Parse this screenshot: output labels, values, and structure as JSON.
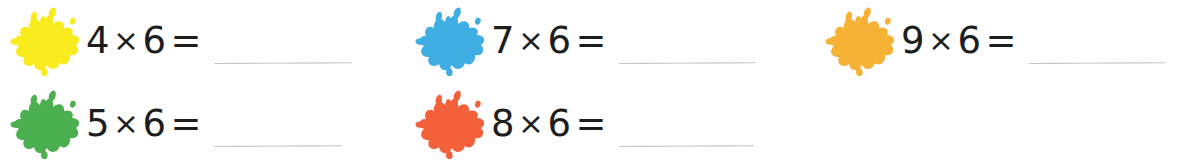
{
  "worksheet": {
    "background_color": "#fefefe",
    "text_color": "#1d1d1d",
    "line_color": "#c0c0c0",
    "columns": 3,
    "rows": 2,
    "operator_symbol": "×",
    "equals_symbol": "=",
    "answer_blank": ""
  },
  "problems": [
    {
      "id": "problem-4x6",
      "position": "row1-col1",
      "splat_name": "paint-splat-yellow",
      "splat_color": "#F9EC1E",
      "multiplicand": "4",
      "operator": "×",
      "multiplier": "6",
      "equals": "=",
      "answer": "",
      "line_width": 138
    },
    {
      "id": "problem-7x6",
      "position": "row1-col2",
      "splat_name": "paint-splat-blue",
      "splat_color": "#3FAEE3",
      "multiplicand": "7",
      "operator": "×",
      "multiplier": "6",
      "equals": "=",
      "answer": "",
      "line_width": 137
    },
    {
      "id": "problem-9x6",
      "position": "row1-col3",
      "splat_name": "paint-splat-amber",
      "splat_color": "#F5B235",
      "multiplicand": "9",
      "operator": "×",
      "multiplier": "6",
      "equals": "=",
      "answer": "",
      "line_width": 136
    },
    {
      "id": "problem-5x6",
      "position": "row2-col1",
      "splat_name": "paint-splat-green",
      "splat_color": "#4CAF4F",
      "multiplicand": "5",
      "operator": "×",
      "multiplier": "6",
      "equals": "=",
      "answer": "",
      "line_width": 128
    },
    {
      "id": "problem-8x6",
      "position": "row2-col2",
      "splat_name": "paint-splat-orange",
      "splat_color": "#F4603A",
      "multiplicand": "8",
      "operator": "×",
      "multiplier": "6",
      "equals": "=",
      "answer": "",
      "line_width": 135
    },
    {
      "id": "problem-empty",
      "position": "row2-col3",
      "splat_name": "",
      "splat_color": "",
      "multiplicand": "",
      "operator": "",
      "multiplier": "",
      "equals": "",
      "answer": "",
      "line_width": 0
    }
  ]
}
